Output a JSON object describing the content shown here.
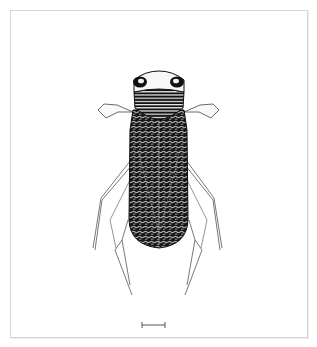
{
  "figure": {
    "style": "black-and-white scientific stipple/line illustration",
    "colors": {
      "ink": "#111111",
      "leg_line": "#555555",
      "frame": "#d6d6d6",
      "background": "#ffffff"
    },
    "scale_bar": {
      "visible": true,
      "label": ""
    }
  }
}
